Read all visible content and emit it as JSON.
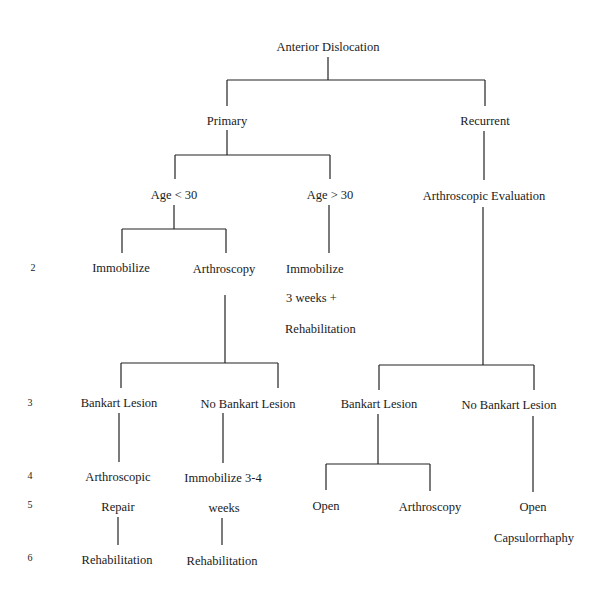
{
  "diagram": {
    "title": "Anterior Dislocation",
    "nodes": {
      "root": "Anterior Dislocation",
      "primary": "Primary",
      "recurrent": "Recurrent",
      "age_lt_30": "Age < 30",
      "age_gt_30": "Age > 30",
      "arthroscopic_evaluation": "Arthroscopic Evaluation",
      "immobilize_a": "Immobilize",
      "arthroscopy_a": "Arthroscopy",
      "immobilize_b_line1": "Immobilize",
      "immobilize_b_line2": "3 weeks +",
      "immobilize_b_line3": "Rehabilitation",
      "bankart_lesion_a": "Bankart Lesion",
      "no_bankart_lesion_a": "No Bankart Lesion",
      "bankart_lesion_b": "Bankart Lesion",
      "no_bankart_lesion_b": "No Bankart Lesion",
      "arthroscopic_repair_line1": "Arthroscopic",
      "arthroscopic_repair_line2": "Repair",
      "immobilize_34_line1": "Immobilize 3-4",
      "immobilize_34_line2": "weeks",
      "open_a": "Open",
      "arthroscopy_b": "Arthroscopy",
      "open_capsulorrhaphy_line1": "Open",
      "open_capsulorrhaphy_line2": "Capsulorrhaphy",
      "rehabilitation_a": "Rehabilitation",
      "rehabilitation_b": "Rehabilitation"
    },
    "row_numbers": [
      "2",
      "3",
      "4",
      "5",
      "6"
    ],
    "line_color": "#222222"
  }
}
